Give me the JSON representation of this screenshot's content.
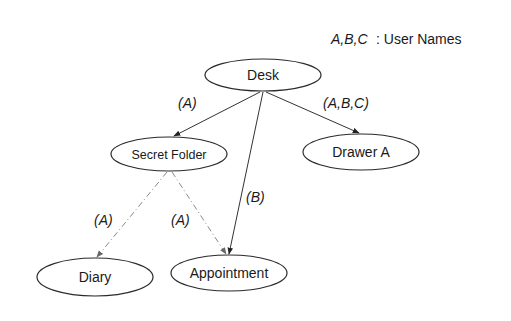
{
  "legend": {
    "keys": "A,B,C",
    "description": ": User Names"
  },
  "nodes": [
    {
      "id": "desk",
      "label": "Desk",
      "cx": 263,
      "cy": 75,
      "rx": 58,
      "ry": 16
    },
    {
      "id": "secret_folder",
      "label": "Secret Folder",
      "cx": 169,
      "cy": 154,
      "rx": 58,
      "ry": 17
    },
    {
      "id": "drawer_a",
      "label": "Drawer A",
      "cx": 361,
      "cy": 152,
      "rx": 58,
      "ry": 18
    },
    {
      "id": "diary",
      "label": "Diary",
      "cx": 95,
      "cy": 277,
      "rx": 58,
      "ry": 19
    },
    {
      "id": "appointment",
      "label": "Appointment",
      "cx": 229,
      "cy": 273,
      "rx": 58,
      "ry": 18
    }
  ],
  "edges": [
    {
      "from": "Desk",
      "to": "Secret Folder",
      "style": "solid",
      "label": "(A)"
    },
    {
      "from": "Desk",
      "to": "Drawer A",
      "style": "solid",
      "label": "(A,B,C)"
    },
    {
      "from": "Desk",
      "to": "Appointment",
      "style": "solid",
      "label": "(B)"
    },
    {
      "from": "Secret Folder",
      "to": "Diary",
      "style": "dashed",
      "label": "(A)"
    },
    {
      "from": "Secret Folder",
      "to": "Appointment",
      "style": "dashed",
      "label": "(A)"
    }
  ]
}
